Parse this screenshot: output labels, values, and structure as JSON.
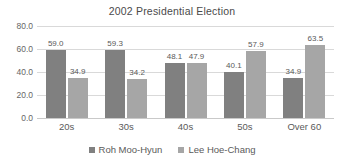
{
  "chart_data": {
    "type": "bar",
    "title": "2002 Presidential Election",
    "xlabel": "",
    "ylabel": "",
    "categories": [
      "20s",
      "30s",
      "40s",
      "50s",
      "Over 60"
    ],
    "series": [
      {
        "name": "Roh Moo-Hyun",
        "color": "#808080",
        "values": [
          59.0,
          59.3,
          48.1,
          40.1,
          34.9
        ],
        "labels": [
          "59.0",
          "59.3",
          "48.1",
          "40.1",
          "34.9"
        ]
      },
      {
        "name": "Lee Hoe-Chang",
        "color": "#a6a6a6",
        "values": [
          34.9,
          34.2,
          47.9,
          57.9,
          63.5
        ],
        "labels": [
          "34.9",
          "34.2",
          "47.9",
          "57.9",
          "63.5"
        ]
      }
    ],
    "ylim": [
      0.0,
      80.0
    ],
    "ytick_values": [
      0.0,
      20.0,
      40.0,
      60.0,
      80.0
    ],
    "ytick_labels": [
      "0.0",
      "20.0",
      "40.0",
      "60.0",
      "80.0"
    ],
    "grid": true,
    "legend_position": "bottom"
  },
  "legend": {
    "entries": [
      {
        "label": "Roh Moo-Hyun"
      },
      {
        "label": "Lee Hoe-Chang"
      }
    ]
  }
}
